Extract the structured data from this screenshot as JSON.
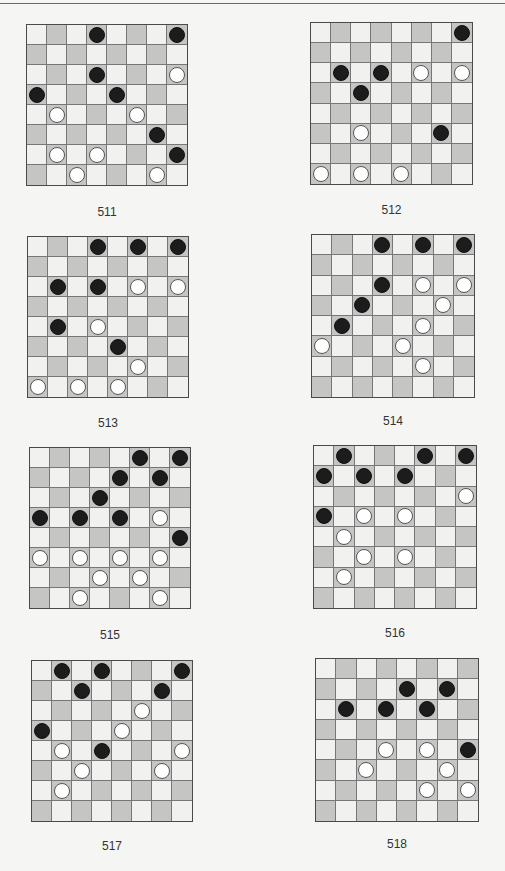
{
  "page": {
    "colors": {
      "background": "#f5f5f3",
      "light_square": "#f1f1ef",
      "dark_square": "#c5c5c3",
      "black_piece": "#1c1c1c",
      "white_piece": "#ffffff"
    }
  },
  "diagrams": [
    {
      "number": "511",
      "box": {
        "left": 26,
        "top": 24,
        "size": 162
      },
      "label_top": 205,
      "pieces": [
        {
          "row": 0,
          "col": 3,
          "color": "black"
        },
        {
          "row": 0,
          "col": 7,
          "color": "black"
        },
        {
          "row": 2,
          "col": 3,
          "color": "black"
        },
        {
          "row": 2,
          "col": 7,
          "color": "white"
        },
        {
          "row": 3,
          "col": 0,
          "color": "black"
        },
        {
          "row": 3,
          "col": 4,
          "color": "black"
        },
        {
          "row": 4,
          "col": 1,
          "color": "white"
        },
        {
          "row": 4,
          "col": 5,
          "color": "white"
        },
        {
          "row": 5,
          "col": 6,
          "color": "black"
        },
        {
          "row": 6,
          "col": 1,
          "color": "white"
        },
        {
          "row": 6,
          "col": 3,
          "color": "white"
        },
        {
          "row": 6,
          "col": 7,
          "color": "black"
        },
        {
          "row": 7,
          "col": 2,
          "color": "white"
        },
        {
          "row": 7,
          "col": 6,
          "color": "white"
        }
      ]
    },
    {
      "number": "512",
      "box": {
        "left": 310,
        "top": 22,
        "size": 163
      },
      "label_top": 203,
      "pieces": [
        {
          "row": 0,
          "col": 7,
          "color": "black"
        },
        {
          "row": 2,
          "col": 1,
          "color": "black"
        },
        {
          "row": 2,
          "col": 3,
          "color": "black"
        },
        {
          "row": 2,
          "col": 5,
          "color": "white"
        },
        {
          "row": 2,
          "col": 7,
          "color": "white"
        },
        {
          "row": 3,
          "col": 2,
          "color": "black"
        },
        {
          "row": 5,
          "col": 2,
          "color": "white"
        },
        {
          "row": 5,
          "col": 6,
          "color": "black"
        },
        {
          "row": 7,
          "col": 0,
          "color": "white"
        },
        {
          "row": 7,
          "col": 2,
          "color": "white"
        },
        {
          "row": 7,
          "col": 4,
          "color": "white"
        }
      ]
    },
    {
      "number": "513",
      "box": {
        "left": 27,
        "top": 236,
        "size": 162
      },
      "label_top": 416,
      "pieces": [
        {
          "row": 0,
          "col": 3,
          "color": "black"
        },
        {
          "row": 0,
          "col": 5,
          "color": "black"
        },
        {
          "row": 0,
          "col": 7,
          "color": "black"
        },
        {
          "row": 2,
          "col": 1,
          "color": "black"
        },
        {
          "row": 2,
          "col": 3,
          "color": "black"
        },
        {
          "row": 2,
          "col": 5,
          "color": "white"
        },
        {
          "row": 2,
          "col": 7,
          "color": "white"
        },
        {
          "row": 4,
          "col": 1,
          "color": "black"
        },
        {
          "row": 4,
          "col": 3,
          "color": "white"
        },
        {
          "row": 5,
          "col": 4,
          "color": "black"
        },
        {
          "row": 6,
          "col": 5,
          "color": "white"
        },
        {
          "row": 7,
          "col": 0,
          "color": "white"
        },
        {
          "row": 7,
          "col": 2,
          "color": "white"
        },
        {
          "row": 7,
          "col": 4,
          "color": "white"
        }
      ]
    },
    {
      "number": "514",
      "box": {
        "left": 311,
        "top": 234,
        "size": 164
      },
      "label_top": 414,
      "pieces": [
        {
          "row": 0,
          "col": 3,
          "color": "black"
        },
        {
          "row": 0,
          "col": 5,
          "color": "black"
        },
        {
          "row": 0,
          "col": 7,
          "color": "black"
        },
        {
          "row": 2,
          "col": 3,
          "color": "black"
        },
        {
          "row": 2,
          "col": 5,
          "color": "white"
        },
        {
          "row": 2,
          "col": 7,
          "color": "white"
        },
        {
          "row": 3,
          "col": 2,
          "color": "black"
        },
        {
          "row": 3,
          "col": 6,
          "color": "white"
        },
        {
          "row": 4,
          "col": 1,
          "color": "black"
        },
        {
          "row": 4,
          "col": 5,
          "color": "white"
        },
        {
          "row": 5,
          "col": 0,
          "color": "white"
        },
        {
          "row": 5,
          "col": 4,
          "color": "white"
        },
        {
          "row": 6,
          "col": 5,
          "color": "white"
        }
      ]
    },
    {
      "number": "515",
      "box": {
        "left": 29,
        "top": 447,
        "size": 162
      },
      "label_top": 628,
      "pieces": [
        {
          "row": 0,
          "col": 5,
          "color": "black"
        },
        {
          "row": 0,
          "col": 7,
          "color": "black"
        },
        {
          "row": 1,
          "col": 4,
          "color": "black"
        },
        {
          "row": 1,
          "col": 6,
          "color": "black"
        },
        {
          "row": 2,
          "col": 3,
          "color": "black"
        },
        {
          "row": 3,
          "col": 0,
          "color": "black"
        },
        {
          "row": 3,
          "col": 2,
          "color": "black"
        },
        {
          "row": 3,
          "col": 4,
          "color": "black"
        },
        {
          "row": 3,
          "col": 6,
          "color": "white"
        },
        {
          "row": 4,
          "col": 7,
          "color": "black"
        },
        {
          "row": 5,
          "col": 0,
          "color": "white"
        },
        {
          "row": 5,
          "col": 2,
          "color": "white"
        },
        {
          "row": 5,
          "col": 4,
          "color": "white"
        },
        {
          "row": 5,
          "col": 6,
          "color": "white"
        },
        {
          "row": 6,
          "col": 3,
          "color": "white"
        },
        {
          "row": 6,
          "col": 5,
          "color": "white"
        },
        {
          "row": 7,
          "col": 2,
          "color": "white"
        },
        {
          "row": 7,
          "col": 6,
          "color": "white"
        }
      ]
    },
    {
      "number": "516",
      "box": {
        "left": 313,
        "top": 445,
        "size": 164
      },
      "label_top": 626,
      "pieces": [
        {
          "row": 0,
          "col": 1,
          "color": "black"
        },
        {
          "row": 0,
          "col": 5,
          "color": "black"
        },
        {
          "row": 0,
          "col": 7,
          "color": "black"
        },
        {
          "row": 1,
          "col": 0,
          "color": "black"
        },
        {
          "row": 1,
          "col": 2,
          "color": "black"
        },
        {
          "row": 1,
          "col": 4,
          "color": "black"
        },
        {
          "row": 2,
          "col": 7,
          "color": "white"
        },
        {
          "row": 3,
          "col": 0,
          "color": "black"
        },
        {
          "row": 3,
          "col": 2,
          "color": "white"
        },
        {
          "row": 3,
          "col": 4,
          "color": "white"
        },
        {
          "row": 4,
          "col": 1,
          "color": "white"
        },
        {
          "row": 5,
          "col": 2,
          "color": "white"
        },
        {
          "row": 5,
          "col": 4,
          "color": "white"
        },
        {
          "row": 6,
          "col": 1,
          "color": "white"
        }
      ]
    },
    {
      "number": "517",
      "box": {
        "left": 31,
        "top": 660,
        "size": 162
      },
      "label_top": 839,
      "pieces": [
        {
          "row": 0,
          "col": 1,
          "color": "black"
        },
        {
          "row": 0,
          "col": 3,
          "color": "black"
        },
        {
          "row": 0,
          "col": 7,
          "color": "black"
        },
        {
          "row": 1,
          "col": 2,
          "color": "black"
        },
        {
          "row": 1,
          "col": 6,
          "color": "black"
        },
        {
          "row": 2,
          "col": 5,
          "color": "white"
        },
        {
          "row": 3,
          "col": 0,
          "color": "black"
        },
        {
          "row": 3,
          "col": 4,
          "color": "white"
        },
        {
          "row": 4,
          "col": 1,
          "color": "white"
        },
        {
          "row": 4,
          "col": 3,
          "color": "black"
        },
        {
          "row": 4,
          "col": 7,
          "color": "white"
        },
        {
          "row": 5,
          "col": 2,
          "color": "white"
        },
        {
          "row": 5,
          "col": 6,
          "color": "white"
        },
        {
          "row": 6,
          "col": 1,
          "color": "white"
        }
      ]
    },
    {
      "number": "518",
      "box": {
        "left": 315,
        "top": 658,
        "size": 164
      },
      "label_top": 837,
      "pieces": [
        {
          "row": 1,
          "col": 4,
          "color": "black"
        },
        {
          "row": 1,
          "col": 6,
          "color": "black"
        },
        {
          "row": 2,
          "col": 1,
          "color": "black"
        },
        {
          "row": 2,
          "col": 3,
          "color": "black"
        },
        {
          "row": 2,
          "col": 5,
          "color": "black"
        },
        {
          "row": 4,
          "col": 3,
          "color": "white"
        },
        {
          "row": 4,
          "col": 5,
          "color": "white"
        },
        {
          "row": 4,
          "col": 7,
          "color": "black"
        },
        {
          "row": 5,
          "col": 2,
          "color": "white"
        },
        {
          "row": 5,
          "col": 6,
          "color": "white"
        },
        {
          "row": 6,
          "col": 5,
          "color": "white"
        },
        {
          "row": 6,
          "col": 7,
          "color": "white"
        }
      ]
    }
  ]
}
